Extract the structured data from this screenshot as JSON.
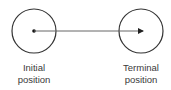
{
  "diagram": {
    "initial": {
      "label_line1": "Initial",
      "label_line2": "position",
      "center": [
        34,
        31
      ],
      "radius": 22
    },
    "terminal": {
      "label_line1": "Terminal",
      "label_line2": "position",
      "center": [
        141,
        31
      ],
      "radius": 22
    },
    "arrow": {
      "from": [
        34,
        31
      ],
      "to": [
        143,
        31
      ],
      "color": "#555555"
    },
    "stroke_color": "#333333"
  }
}
